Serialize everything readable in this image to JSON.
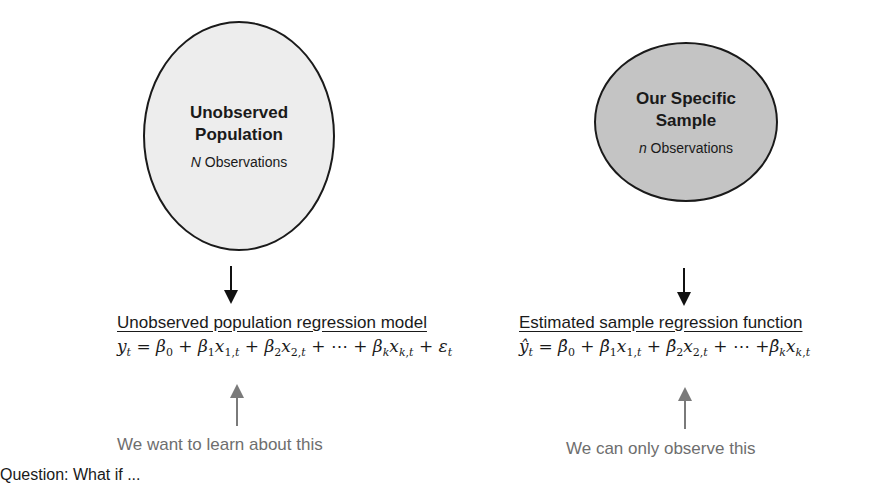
{
  "population": {
    "title_line1": "Unobserved",
    "title_line2": "Population",
    "count_symbol": "N",
    "count_label": " Observations",
    "fill_color": "#ededed",
    "heading": "Unobserved population regression model",
    "equation": "y_t = β_0 + β_1 x_{1,t} + β_2 x_{2,t} + ⋯ + β_k x_{k,t} + ε_t",
    "caption": "We want to learn about this"
  },
  "sample": {
    "title_line1": "Our Specific",
    "title_line2": "Sample",
    "count_symbol": "n",
    "count_label": " Observations",
    "fill_color": "#c4c4c4",
    "heading": "Estimated sample regression function",
    "equation": "ŷ_t = β̂_0 + β̂_1 x_{1,t} + β̂_2 x_{2,t} + ⋯ + β̂_k x_{k,t}",
    "caption": "We can only observe this"
  },
  "footer_cut_text": "Question: What if ..."
}
